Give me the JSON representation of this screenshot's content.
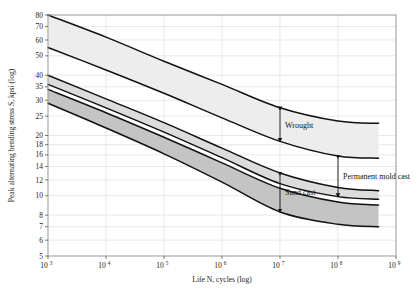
{
  "figure": {
    "background": "#ffffff",
    "plot_border_color": "#9a9a9a",
    "grid_color": "#d9d9d9",
    "curve_color": "#111111"
  },
  "chart_data": {
    "type": "area",
    "title": "",
    "subtitle": "",
    "xlabel": "Life N, cycles (log)",
    "ylabel": "Peak alternating bending stress S, kpsi (log)",
    "xscale": "log",
    "yscale": "log",
    "xlim": [
      1000,
      1000000000
    ],
    "ylim": [
      5,
      80
    ],
    "grid": true,
    "legend_position": "inline-annotations",
    "xticks": [
      {
        "value": 1000,
        "base": "10",
        "exp": "3"
      },
      {
        "value": 10000,
        "base": "10",
        "exp": "4"
      },
      {
        "value": 100000,
        "base": "10",
        "exp": "5"
      },
      {
        "value": 1000000,
        "base": "10",
        "exp": "6"
      },
      {
        "value": 10000000,
        "base": "10",
        "exp": "7"
      },
      {
        "value": 100000000,
        "base": "10",
        "exp": "8"
      },
      {
        "value": 1000000000,
        "base": "10",
        "exp": "9"
      }
    ],
    "yticks": [
      80,
      70,
      60,
      50,
      40,
      35,
      30,
      25,
      20,
      18,
      16,
      14,
      12,
      10,
      8,
      7,
      6,
      5
    ],
    "bands": [
      {
        "name": "Wrought",
        "fill": "#ededed",
        "x": [
          1000,
          10000,
          100000,
          1000000,
          10000000,
          100000000,
          500000000
        ],
        "upper": [
          80,
          62,
          47,
          36,
          27.5,
          23.6,
          23.0
        ],
        "lower": [
          55,
          42.5,
          32.5,
          24.5,
          18.7,
          15.8,
          15.4
        ]
      },
      {
        "name": "Permanent mold cast",
        "fill": "#dcdcdc",
        "x": [
          1000,
          10000,
          100000,
          1000000,
          10000000,
          100000000,
          500000000
        ],
        "upper": [
          40,
          30.5,
          23.2,
          17.3,
          13.0,
          11.0,
          10.6
        ],
        "lower": [
          36,
          27.5,
          20.8,
          15.5,
          11.5,
          9.9,
          9.6
        ]
      },
      {
        "name": "Sand cast",
        "fill": "#c4c4c4",
        "x": [
          1000,
          10000,
          100000,
          1000000,
          10000000,
          100000000,
          500000000
        ],
        "upper": [
          34,
          26.0,
          19.6,
          14.6,
          10.9,
          9.3,
          9.0
        ],
        "lower": [
          29,
          21.8,
          16.2,
          11.7,
          8.3,
          7.2,
          7.0
        ]
      }
    ],
    "annotations": [
      {
        "label": "Wrought",
        "arrow_x": 10000000,
        "arrow_top": 27.5,
        "arrow_bottom": 18.7
      },
      {
        "label": "Permanent mold cast",
        "arrow_x": 100000000,
        "arrow_top": 15.8,
        "arrow_bottom": 9.9
      },
      {
        "label": "Sand cast",
        "arrow_x": 10000000,
        "arrow_top": 13.0,
        "arrow_bottom": 8.3
      }
    ]
  }
}
